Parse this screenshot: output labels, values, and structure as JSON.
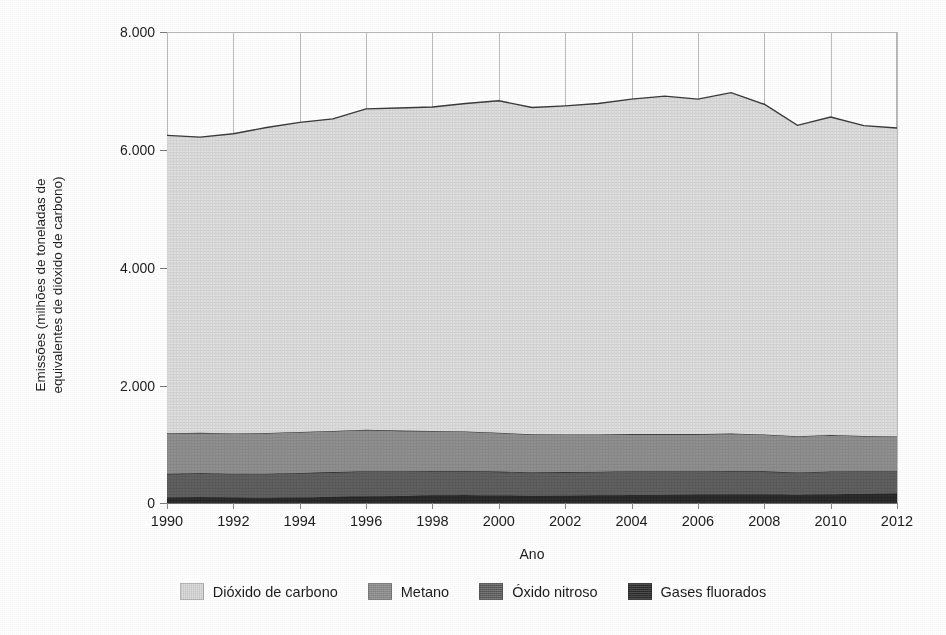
{
  "figure": {
    "clipped_title_sliver": "",
    "background": "#ffffff"
  },
  "axes": {
    "ylabel_line1": "Emissões (milhões de toneladas de",
    "ylabel_line2": "equivalentes de dióxido de carbono)",
    "ylabel": "Emissões (milhões de toneladas de\nequivalentes de dióxido de carbono)",
    "xlabel": "Ano",
    "ytick_labels": [
      "8.000",
      "6.000",
      "4.000",
      "2.000",
      "0"
    ],
    "xtick_labels": [
      "1990",
      "1992",
      "1994",
      "1996",
      "1998",
      "2000",
      "2002",
      "2004",
      "2006",
      "2008",
      "2010",
      "2012"
    ]
  },
  "legend": {
    "items": [
      {
        "label": "Dióxido de carbono",
        "color": "#dcdcdc"
      },
      {
        "label": "Metano",
        "color": "#8d8d8d"
      },
      {
        "label": "Óxido nitroso",
        "color": "#5e5e5e"
      },
      {
        "label": "Gases fluorados",
        "color": "#2b2b2b"
      }
    ]
  },
  "chart_data": {
    "type": "area",
    "stacked": true,
    "title": "",
    "xlabel": "Ano",
    "ylabel": "Emissões (milhões de toneladas de equivalentes de dióxido de carbono)",
    "ylim": [
      0,
      8000
    ],
    "xlim": [
      1990,
      2012
    ],
    "ytick_values": [
      0,
      2000,
      4000,
      6000,
      8000
    ],
    "grid": "vertical",
    "legend_position": "bottom",
    "x": [
      1990,
      1991,
      1992,
      1993,
      1994,
      1995,
      1996,
      1997,
      1998,
      1999,
      2000,
      2001,
      2002,
      2003,
      2004,
      2005,
      2006,
      2007,
      2008,
      2009,
      2010,
      2011,
      2012
    ],
    "series": [
      {
        "name": "Gases fluorados",
        "color": "#2b2b2b",
        "values": [
          95,
          100,
          92,
          88,
          95,
          105,
          115,
          120,
          130,
          135,
          128,
          122,
          125,
          130,
          135,
          140,
          145,
          150,
          148,
          140,
          150,
          155,
          160
        ]
      },
      {
        "name": "Óxido nitroso",
        "color": "#5e5e5e",
        "values": [
          400,
          405,
          405,
          410,
          415,
          420,
          425,
          420,
          415,
          410,
          405,
          400,
          400,
          400,
          405,
          400,
          395,
          395,
          390,
          380,
          385,
          385,
          380
        ]
      },
      {
        "name": "Metano",
        "color": "#8d8d8d",
        "values": [
          690,
          690,
          685,
          690,
          695,
          700,
          705,
          690,
          680,
          670,
          660,
          645,
          640,
          635,
          630,
          630,
          630,
          635,
          625,
          615,
          620,
          600,
          590
        ]
      },
      {
        "name": "Dióxido de carbono",
        "color": "#dcdcdc",
        "values": [
          5060,
          5020,
          5090,
          5190,
          5260,
          5300,
          5450,
          5480,
          5500,
          5570,
          5640,
          5550,
          5580,
          5620,
          5690,
          5740,
          5690,
          5790,
          5610,
          5280,
          5400,
          5270,
          5240
        ]
      }
    ],
    "totals": [
      6245,
      6215,
      6272,
      6378,
      6465,
      6525,
      6695,
      6710,
      6725,
      6785,
      6833,
      6717,
      6745,
      6785,
      6860,
      6910,
      6860,
      6970,
      6773,
      6415,
      6555,
      6410,
      6370
    ],
    "units": "milhões de toneladas de CO2 equivalente"
  }
}
